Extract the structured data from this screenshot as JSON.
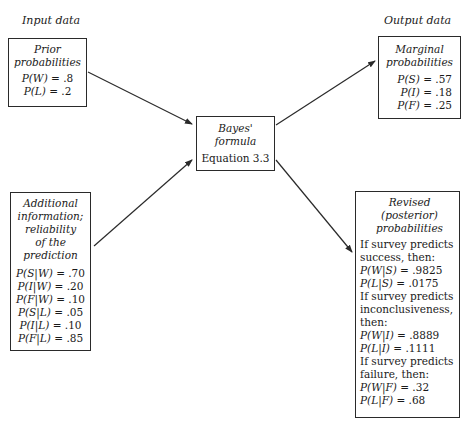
{
  "labels": {
    "input": "Input data",
    "output": "Output data"
  },
  "prior": {
    "title_lines": [
      "Prior",
      "probabilities"
    ],
    "items": [
      {
        "expr": "P(W)",
        "value": ".8"
      },
      {
        "expr": "P(L)",
        "value": ".2"
      }
    ]
  },
  "additional": {
    "title_lines": [
      "Additional",
      "information;",
      "reliability",
      "of the",
      "prediction"
    ],
    "items": [
      {
        "expr": "P(S|W)",
        "value": ".70"
      },
      {
        "expr": "P(I|W)",
        "value": ".20"
      },
      {
        "expr": "P(F|W)",
        "value": ".10"
      },
      {
        "expr": "P(S|L)",
        "value": ".05"
      },
      {
        "expr": "P(I|L)",
        "value": ".10"
      },
      {
        "expr": "P(F|L)",
        "value": ".85"
      }
    ]
  },
  "bayes": {
    "title_lines": [
      "Bayes'",
      "formula"
    ],
    "equation": "Equation 3.3"
  },
  "marginal": {
    "title_lines": [
      "Marginal",
      "probabilities"
    ],
    "items": [
      {
        "expr": "P(S)",
        "value": ".57"
      },
      {
        "expr": "P(I)",
        "value": ".18"
      },
      {
        "expr": "P(F)",
        "value": ".25"
      }
    ]
  },
  "revised": {
    "title_lines": [
      "Revised",
      "(posterior)",
      "probabilities"
    ],
    "groups": [
      {
        "condition_lines": [
          "If survey predicts",
          "success, then:"
        ],
        "items": [
          {
            "expr": "P(W|S)",
            "value": ".9825"
          },
          {
            "expr": "P(L|S)",
            "value": ".0175"
          }
        ]
      },
      {
        "condition_lines": [
          "If survey predicts",
          "inconclusiveness,",
          "then:"
        ],
        "items": [
          {
            "expr": "P(W|I)",
            "value": ".8889"
          },
          {
            "expr": "P(L|I)",
            "value": ".1111"
          }
        ]
      },
      {
        "condition_lines": [
          "If survey predicts",
          "failure, then:"
        ],
        "items": [
          {
            "expr": "P(W|F)",
            "value": ".32"
          },
          {
            "expr": "P(L|F)",
            "value": ".68"
          }
        ]
      }
    ]
  },
  "arrows": [
    {
      "from": "prior",
      "to": "bayes"
    },
    {
      "from": "additional",
      "to": "bayes"
    },
    {
      "from": "bayes",
      "to": "marginal"
    },
    {
      "from": "bayes",
      "to": "revised"
    }
  ],
  "colors": {
    "line": "#2a2a2a",
    "background": "#ffffff"
  }
}
